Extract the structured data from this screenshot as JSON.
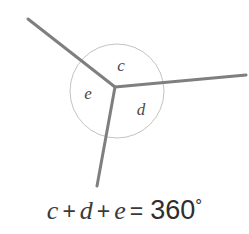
{
  "figure": {
    "name": "angles-around-a-point-diagram",
    "width": 249,
    "height": 234,
    "background_color": "#ffffff"
  },
  "geometry": {
    "vertex": {
      "x": 115,
      "y": 87
    },
    "rays": [
      {
        "name": "ray-upper-left",
        "x1": 115,
        "y1": 87,
        "x2": 28,
        "y2": 19
      },
      {
        "name": "ray-right",
        "x1": 115,
        "y1": 87,
        "x2": 246,
        "y2": 75
      },
      {
        "name": "ray-lower-left",
        "x1": 115,
        "y1": 87,
        "x2": 97,
        "y2": 186
      }
    ],
    "ray_color": "#7f7f7f",
    "ray_width": 3,
    "circle": {
      "name": "angle-arc-circle",
      "cx": 117,
      "cy": 91,
      "r": 47,
      "stroke_color": "#c3c3c3",
      "stroke_width": 1,
      "fill": "none"
    }
  },
  "labels": [
    {
      "name": "angle-label-c",
      "text": "c",
      "x": 121,
      "y": 67
    },
    {
      "name": "angle-label-e",
      "text": "e",
      "x": 88,
      "y": 95
    },
    {
      "name": "angle-label-d",
      "text": "d",
      "x": 141,
      "y": 111
    }
  ],
  "equation": {
    "var_c": "c",
    "plus_1": "+",
    "var_d": "d",
    "plus_2": "+",
    "var_e": "e",
    "equals": "=",
    "value": "360",
    "degree": "°",
    "full_text": "c + d + e = 360°"
  },
  "colors": {
    "ray": "#7f7f7f",
    "arc": "#c3c3c3",
    "label_text": "#4a4a4a",
    "equation_text": "#3a3a3a",
    "number_text": "#2e2e2e"
  }
}
